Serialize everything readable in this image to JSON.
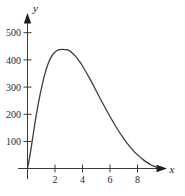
{
  "figure": {
    "background": "#ffffff",
    "axis_color": "#3a3a3a",
    "curve_color": "#3d3d3d"
  },
  "axes": {
    "x_name": "x",
    "y_name": "y",
    "x_ticks": [
      "2",
      "4",
      "6",
      "8"
    ],
    "y_ticks": [
      "100",
      "200",
      "300",
      "400",
      "500"
    ]
  },
  "chart_data": {
    "type": "line",
    "title": "",
    "xlabel": "x",
    "ylabel": "y",
    "xlim": [
      0,
      10
    ],
    "ylim": [
      0,
      560
    ],
    "grid": false,
    "legend": null,
    "x_ticks": [
      2,
      4,
      6,
      8
    ],
    "y_ticks": [
      100,
      200,
      300,
      400,
      500
    ],
    "series": [
      {
        "name": "curve",
        "color": "#3d3d3d",
        "x": [
          0,
          0.2,
          0.4,
          0.6,
          0.8,
          1.0,
          1.25,
          1.5,
          1.75,
          2.0,
          2.25,
          2.5,
          2.75,
          3.0,
          3.25,
          3.5,
          3.75,
          4.0,
          4.5,
          5.0,
          5.5,
          6.0,
          6.5,
          7.0,
          7.5,
          8.0,
          8.5,
          9.0,
          9.4
        ],
        "y": [
          0,
          55,
          120,
          185,
          242,
          292,
          345,
          385,
          412,
          428,
          436,
          438,
          437,
          434,
          425,
          412,
          396,
          377,
          333,
          285,
          237,
          191,
          148,
          110,
          77,
          50,
          29,
          13,
          5
        ]
      }
    ]
  }
}
